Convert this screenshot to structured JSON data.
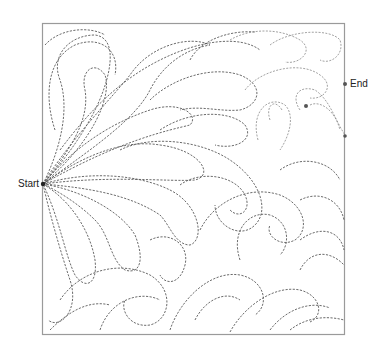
{
  "diagram": {
    "type": "quilting-pattern",
    "labels": {
      "start": "Start",
      "end": "End"
    },
    "colors": {
      "frame": "#9a9a9a",
      "stitch_dark": "#5a5a5a",
      "stitch_light": "#8a8a8a",
      "marker": "#222222"
    }
  }
}
